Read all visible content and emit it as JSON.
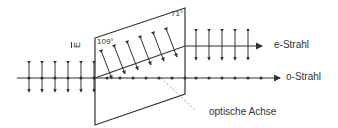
{
  "diagram": {
    "labels": {
      "e_beam": "e-Strahl",
      "o_beam": "o-Strahl",
      "optical_axis": "optische Achse",
      "angle_left": "109°",
      "angle_right": "71°",
      "efield": "E"
    },
    "colors": {
      "line": "#333333",
      "dashed_axis": "#888888",
      "background": "#ffffff"
    },
    "incoming_arrows_x": [
      29,
      42,
      55,
      68,
      81,
      94
    ],
    "e_inside_arrows": [
      [
        107,
        66
      ],
      [
        120,
        61
      ],
      [
        133,
        57
      ],
      [
        146,
        52
      ],
      [
        159,
        48
      ],
      [
        172,
        44
      ]
    ],
    "e_outside_arrows_x": [
      196,
      209,
      222,
      235,
      248
    ],
    "o_dots_x": [
      107,
      120,
      133,
      146,
      159,
      172,
      185,
      196,
      209,
      222,
      235,
      248,
      261
    ]
  }
}
